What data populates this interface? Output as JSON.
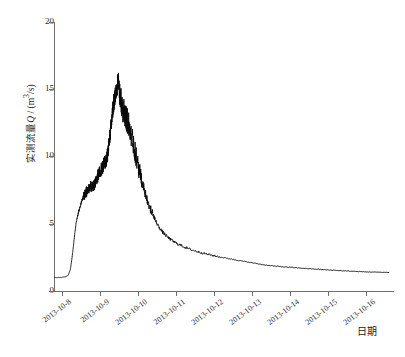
{
  "chart_data": {
    "type": "line",
    "title": "",
    "xlabel": "日期",
    "ylabel": "实测流量 Q / (m³/s)",
    "ylabel_parts": {
      "name": "实测流量",
      "symbol": "Q",
      "sep": " / (m",
      "exp": "3",
      "unit": "/s)"
    },
    "ylim": [
      0,
      20
    ],
    "yticks": [
      0,
      5,
      10,
      15,
      20
    ],
    "ytick_labels": [
      "0",
      "5",
      "10",
      "15",
      "20"
    ],
    "xticks": [
      "2013-10-8",
      "2013-10-9",
      "2013-10-10",
      "2013-10-11",
      "2013-10-12",
      "2013-10-13",
      "2013-10-14",
      "2013-10-15",
      "2013-10-16"
    ],
    "xlim": [
      "2013-10-7.8",
      "2013-10-16.6"
    ],
    "grid": false,
    "legend": null,
    "series": [
      {
        "name": "实测流量",
        "color": "#0a0a0a",
        "units": "m^3/s",
        "x_days_from_2013_10_08": [
          -0.2,
          -0.1,
          0.0,
          0.08,
          0.16,
          0.22,
          0.27,
          0.31,
          0.34,
          0.37,
          0.4,
          0.43,
          0.46,
          0.49,
          0.52,
          0.56,
          0.6,
          0.64,
          0.68,
          0.72,
          0.76,
          0.8,
          0.84,
          0.88,
          0.92,
          0.96,
          1.0,
          1.04,
          1.08,
          1.12,
          1.16,
          1.2,
          1.24,
          1.28,
          1.32,
          1.36,
          1.4,
          1.44,
          1.48,
          1.52,
          1.56,
          1.6,
          1.64,
          1.68,
          1.72,
          1.76,
          1.8,
          1.86,
          1.92,
          1.98,
          2.05,
          2.12,
          2.2,
          2.3,
          2.4,
          2.52,
          2.64,
          2.78,
          2.92,
          3.08,
          3.24,
          3.42,
          3.6,
          3.8,
          4.0,
          4.25,
          4.5,
          4.75,
          5.0,
          5.3,
          5.6,
          5.9,
          6.2,
          6.5,
          6.8,
          7.1,
          7.4,
          7.7,
          8.0,
          8.3,
          8.6
        ],
        "y_discharge": [
          1.0,
          1.0,
          1.02,
          1.05,
          1.15,
          1.6,
          2.6,
          3.6,
          4.4,
          5.0,
          5.45,
          5.8,
          6.1,
          6.4,
          6.7,
          6.95,
          7.15,
          7.35,
          7.55,
          7.7,
          7.75,
          7.7,
          7.85,
          8.1,
          8.4,
          8.65,
          8.85,
          9.05,
          9.3,
          9.55,
          9.6,
          10.2,
          11.0,
          12.0,
          13.0,
          14.0,
          14.6,
          15.1,
          15.5,
          14.6,
          13.9,
          13.5,
          13.3,
          13.0,
          12.6,
          12.3,
          11.9,
          11.2,
          10.4,
          9.6,
          8.8,
          8.0,
          7.2,
          6.3,
          5.6,
          4.9,
          4.4,
          4.0,
          3.7,
          3.45,
          3.25,
          3.05,
          2.9,
          2.75,
          2.62,
          2.48,
          2.35,
          2.22,
          2.1,
          1.95,
          1.85,
          1.78,
          1.72,
          1.66,
          1.6,
          1.55,
          1.5,
          1.46,
          1.42,
          1.4,
          1.38
        ],
        "peak_value": 15.5,
        "peak_date": "2013-10-09",
        "baseline_value": 1.0,
        "recession_value": 1.38
      }
    ]
  },
  "axes": {
    "y_title_text": "实测流量 Q / (m³/s)",
    "x_title_text": "日期"
  }
}
